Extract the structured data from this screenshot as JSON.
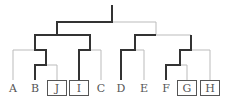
{
  "diagram": {
    "type": "cladogram",
    "colors": {
      "highlight": "#333333",
      "normal": "#bbbbbb",
      "box": "#555555",
      "label": "#555555"
    },
    "leaves": [
      {
        "label": "A",
        "boxed": false
      },
      {
        "label": "B",
        "boxed": false
      },
      {
        "label": "J",
        "boxed": true
      },
      {
        "label": "I",
        "boxed": true
      },
      {
        "label": "C",
        "boxed": false
      },
      {
        "label": "D",
        "boxed": false
      },
      {
        "label": "E",
        "boxed": false
      },
      {
        "label": "F",
        "boxed": false
      },
      {
        "label": "G",
        "boxed": true
      },
      {
        "label": "H",
        "boxed": true
      }
    ]
  }
}
